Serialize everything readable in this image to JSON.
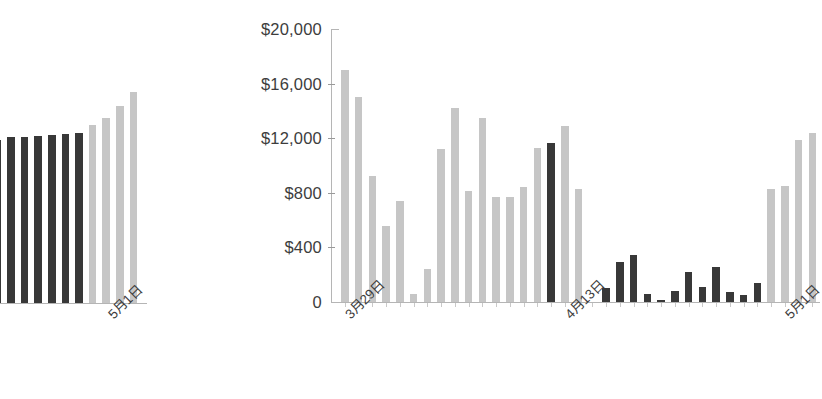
{
  "page": {
    "background": "#ffffff"
  },
  "colors": {
    "bar_light": "#c6c6c6",
    "bar_dark": "#383838",
    "axis": "#b5b5b5",
    "tick": "#9a9a9a",
    "text": "#3d3d3d"
  },
  "chart_data": [
    {
      "id": "left-chart-cropped",
      "type": "bar",
      "title": "",
      "xlabel": "",
      "ylabel": "",
      "note": "Partially cropped chart at left edge; y-axis not visible",
      "grid": false,
      "legend": null,
      "ylim": [
        0,
        20000
      ],
      "x_tick_labels": [
        {
          "label": "5月1日",
          "index": 9
        }
      ],
      "series": [
        {
          "name": "values",
          "values": [
            11400,
            11500,
            11700,
            11750,
            11800,
            11900,
            11950,
            12000,
            12600,
            13100,
            13900,
            14900
          ],
          "colors": [
            "#383838",
            "#383838",
            "#383838",
            "#383838",
            "#383838",
            "#383838",
            "#383838",
            "#383838",
            "#c6c6c6",
            "#c6c6c6",
            "#c6c6c6",
            "#c6c6c6"
          ]
        }
      ]
    },
    {
      "id": "main-chart",
      "type": "bar",
      "title": "",
      "xlabel": "",
      "ylabel": "",
      "grid": false,
      "legend": null,
      "ylim": [
        0,
        20000
      ],
      "y_tick_labels": [
        "$20,000",
        "$16,000",
        "$12,000",
        "$800",
        "$400",
        "0"
      ],
      "y_tick_values": [
        20000,
        16000,
        12000,
        8000,
        4000,
        0
      ],
      "x_tick_labels": [
        {
          "label": "3月29日",
          "index": 0
        },
        {
          "label": "4月13日",
          "index": 16
        },
        {
          "label": "5月1日",
          "index": 32
        }
      ],
      "categories": [
        "3月29日",
        "3月30日",
        "3月31日",
        "4月1日",
        "4月2日",
        "4月3日",
        "4月4日",
        "4月5日",
        "4月6日",
        "4月7日",
        "4月8日",
        "4月9日",
        "4月10日",
        "4月11日",
        "4月12日",
        "4月13日",
        "4月14日",
        "4月15日",
        "4月16日",
        "4月17日",
        "4月18日",
        "4月19日",
        "4月20日",
        "4月21日",
        "4月22日",
        "4月23日",
        "4月24日",
        "4月25日",
        "4月26日",
        "4月27日",
        "4月28日",
        "4月29日",
        "4月30日",
        "5月1日",
        "5月2日"
      ],
      "series": [
        {
          "name": "values",
          "values": [
            17000,
            15000,
            9200,
            5600,
            7400,
            600,
            2400,
            11200,
            14200,
            8100,
            13500,
            7700,
            7700,
            8400,
            11300,
            11650,
            12900,
            8300,
            0,
            1000,
            2900,
            3450,
            600,
            150,
            800,
            2200,
            1100,
            2600,
            700,
            500,
            1400,
            8300,
            8500,
            11900,
            12400
          ],
          "colors": [
            "#c6c6c6",
            "#c6c6c6",
            "#c6c6c6",
            "#c6c6c6",
            "#c6c6c6",
            "#c6c6c6",
            "#c6c6c6",
            "#c6c6c6",
            "#c6c6c6",
            "#c6c6c6",
            "#c6c6c6",
            "#c6c6c6",
            "#c6c6c6",
            "#c6c6c6",
            "#c6c6c6",
            "#383838",
            "#c6c6c6",
            "#c6c6c6",
            "#c6c6c6",
            "#383838",
            "#383838",
            "#383838",
            "#383838",
            "#383838",
            "#383838",
            "#383838",
            "#383838",
            "#383838",
            "#383838",
            "#383838",
            "#383838",
            "#c6c6c6",
            "#c6c6c6",
            "#c6c6c6",
            "#c6c6c6"
          ]
        }
      ]
    }
  ]
}
